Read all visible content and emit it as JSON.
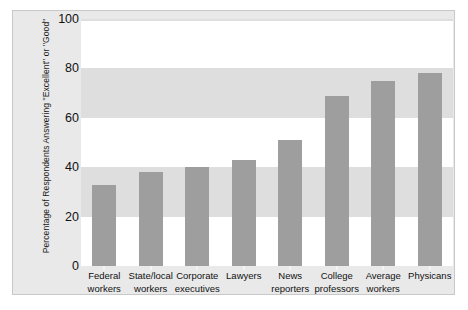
{
  "chart_data": {
    "type": "bar",
    "title": "",
    "xlabel": "",
    "ylabel": "Percentage of Respondents Answering \"Excellent\" or \"Good\"",
    "ylim": [
      0,
      100
    ],
    "yticks": [
      0,
      20,
      40,
      60,
      80,
      100
    ],
    "ytick_labels": [
      "0",
      "20",
      "40",
      "60",
      "80",
      "100"
    ],
    "grid": "horizontal-alternating-bands",
    "legend": "none",
    "bar_color": "#9e9e9e",
    "band_color": "#dedede",
    "panel_color": "#e9e9e9",
    "plot_background": "#ffffff",
    "categories": [
      "Federal workers",
      "State/local workers",
      "Corporate executives",
      "Lawyers",
      "News reporters",
      "College professors",
      "Average workers",
      "Physicans"
    ],
    "category_lines": [
      [
        "Federal",
        "workers"
      ],
      [
        "State/local",
        "workers"
      ],
      [
        "Corporate",
        "executives"
      ],
      [
        "Lawyers",
        ""
      ],
      [
        "News",
        "reporters"
      ],
      [
        "College",
        "professors"
      ],
      [
        "Average",
        "workers"
      ],
      [
        "Physicans",
        ""
      ]
    ],
    "values": [
      33,
      38,
      40,
      43,
      51,
      69,
      75,
      78
    ]
  }
}
